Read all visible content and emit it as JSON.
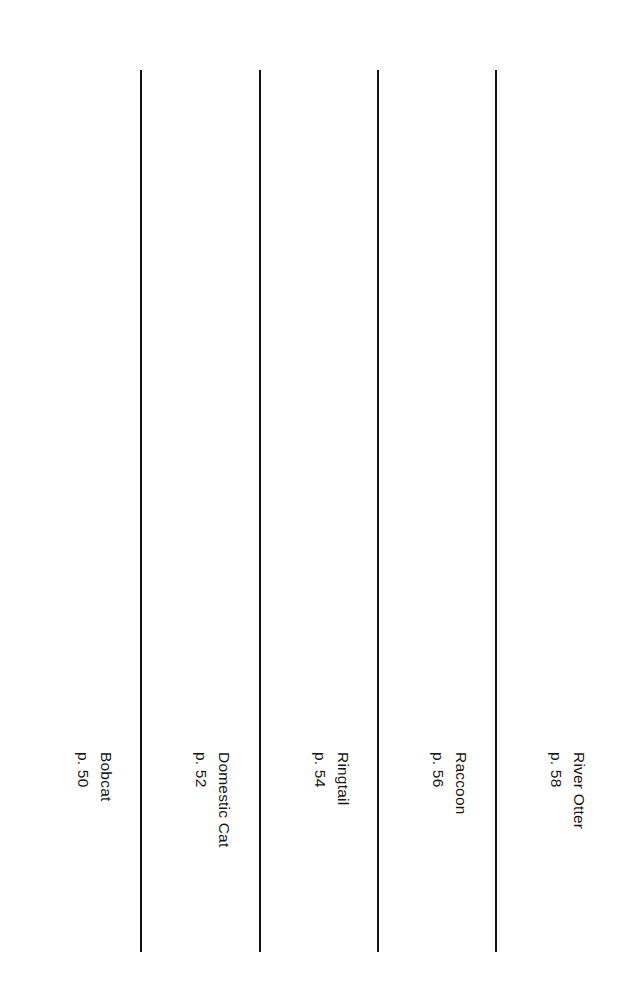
{
  "plate": {
    "title": "Animal Tracks Comparison Plate",
    "background_color": "#ffffff",
    "ink_color": "#2b2b2b",
    "divider_color": "#121212",
    "width": 628,
    "height": 998
  },
  "columns": [
    {
      "id": "bobcat",
      "name": "Bobcat",
      "page": "p. 50",
      "print_type": "feline-four-toe",
      "claws": false,
      "gait": "alternating-single-diagonal-walk",
      "specimen_print": {
        "x": 78,
        "y": 125,
        "scale": 1.0,
        "tone": 0.78
      },
      "trail_tracks": [
        {
          "x": 62,
          "y": 228,
          "scale": 0.3,
          "tone": 0.8,
          "rot": -4
        },
        {
          "x": 110,
          "y": 332,
          "scale": 0.3,
          "tone": 0.8,
          "rot": 4
        },
        {
          "x": 62,
          "y": 453,
          "scale": 0.3,
          "tone": 0.8,
          "rot": -3
        },
        {
          "x": 103,
          "y": 570,
          "scale": 0.3,
          "tone": 0.8,
          "rot": 3
        },
        {
          "x": 58,
          "y": 686,
          "scale": 0.3,
          "tone": 0.8,
          "rot": -2
        }
      ],
      "label": {
        "name_x": 97,
        "name_y": 752,
        "page_x": 74,
        "page_y": 752
      }
    },
    {
      "id": "domestic-cat",
      "name": "Domestic Cat",
      "page": "p. 52",
      "print_type": "feline-four-toe",
      "claws": false,
      "gait": "paired-direct-register-walk",
      "specimen_print": {
        "x": 201,
        "y": 123,
        "scale": 0.92,
        "tone": 0.86
      },
      "trail_tracks": [
        {
          "x": 199,
          "y": 219,
          "scale": 0.22,
          "tone": 0.8,
          "rot": -3
        },
        {
          "x": 200,
          "y": 243,
          "scale": 0.22,
          "tone": 0.8,
          "rot": 2
        },
        {
          "x": 221,
          "y": 362,
          "scale": 0.22,
          "tone": 0.8,
          "rot": -2
        },
        {
          "x": 223,
          "y": 386,
          "scale": 0.22,
          "tone": 0.8,
          "rot": 3
        },
        {
          "x": 182,
          "y": 489,
          "scale": 0.22,
          "tone": 0.8,
          "rot": -3
        },
        {
          "x": 184,
          "y": 514,
          "scale": 0.22,
          "tone": 0.8,
          "rot": 2
        },
        {
          "x": 203,
          "y": 639,
          "scale": 0.22,
          "tone": 0.8,
          "rot": 0
        },
        {
          "x": 180,
          "y": 718,
          "scale": 0.22,
          "tone": 0.8,
          "rot": 0
        }
      ],
      "label": {
        "name_x": 215,
        "name_y": 752,
        "page_x": 192,
        "page_y": 752
      }
    },
    {
      "id": "ringtail",
      "name": "Ringtail",
      "page": "p. 54",
      "print_type": "ringtail-five-toe",
      "claws": true,
      "gait": "overlapping-pair-bound",
      "specimen_print": {
        "x": 319,
        "y": 124,
        "scale": 0.9,
        "tone": 0.6
      },
      "trail_tracks": [
        {
          "x": 297,
          "y": 222,
          "scale": 0.26,
          "tone": 0.7,
          "rot": -6
        },
        {
          "x": 344,
          "y": 358,
          "scale": 0.26,
          "tone": 0.7,
          "rot": 5
        },
        {
          "x": 293,
          "y": 485,
          "scale": 0.26,
          "tone": 0.7,
          "rot": -5
        },
        {
          "x": 349,
          "y": 596,
          "scale": 0.26,
          "tone": 0.7,
          "rot": 4
        },
        {
          "x": 297,
          "y": 680,
          "scale": 0.26,
          "tone": 0.7,
          "rot": -4
        }
      ],
      "label": {
        "name_x": 334,
        "name_y": 752,
        "page_x": 311,
        "page_y": 752
      }
    },
    {
      "id": "raccoon",
      "name": "Raccoon",
      "page": "p. 56",
      "print_type": "raccoon-hand",
      "claws": true,
      "gait": "paired-side-by-side-pace",
      "specimen_print": {
        "x": 436,
        "y": 120,
        "scale": 0.95,
        "tone": 0.74
      },
      "trail_tracks": [
        {
          "x": 409,
          "y": 232,
          "scale": 0.4,
          "tone": 0.84,
          "rot": -5
        },
        {
          "x": 458,
          "y": 234,
          "scale": 0.34,
          "tone": 0.84,
          "rot": 4
        },
        {
          "x": 410,
          "y": 383,
          "scale": 0.36,
          "tone": 0.84,
          "rot": -4
        },
        {
          "x": 459,
          "y": 381,
          "scale": 0.42,
          "tone": 0.84,
          "rot": 3
        },
        {
          "x": 410,
          "y": 528,
          "scale": 0.42,
          "tone": 0.84,
          "rot": -4
        },
        {
          "x": 459,
          "y": 532,
          "scale": 0.34,
          "tone": 0.84,
          "rot": 3
        },
        {
          "x": 411,
          "y": 678,
          "scale": 0.34,
          "tone": 0.84,
          "rot": -3
        },
        {
          "x": 460,
          "y": 676,
          "scale": 0.42,
          "tone": 0.84,
          "rot": 4
        }
      ],
      "label": {
        "name_x": 452,
        "name_y": 752,
        "page_x": 429,
        "page_y": 752
      }
    },
    {
      "id": "river-otter",
      "name": "River Otter",
      "page": "p. 58",
      "print_type": "otter-five-toe",
      "claws": true,
      "gait": "lope-with-tail-drag",
      "tail_drag": true,
      "specimen_print": {
        "x": 555,
        "y": 118,
        "scale": 0.92,
        "tone": 0.72
      },
      "trail_tracks": [
        {
          "x": 561,
          "y": 222,
          "scale": 0.3,
          "tone": 0.82,
          "rot": 10
        },
        {
          "x": 537,
          "y": 252,
          "scale": 0.27,
          "tone": 0.82,
          "rot": -8
        },
        {
          "x": 578,
          "y": 277,
          "scale": 0.27,
          "tone": 0.82,
          "rot": 8
        },
        {
          "x": 570,
          "y": 302,
          "scale": 0.27,
          "tone": 0.82,
          "rot": 6
        },
        {
          "x": 530,
          "y": 382,
          "scale": 0.29,
          "tone": 0.82,
          "rot": -10
        },
        {
          "x": 557,
          "y": 432,
          "scale": 0.29,
          "tone": 0.82,
          "rot": 4
        },
        {
          "x": 580,
          "y": 466,
          "scale": 0.27,
          "tone": 0.82,
          "rot": 8
        },
        {
          "x": 537,
          "y": 550,
          "scale": 0.29,
          "tone": 0.82,
          "rot": -8
        },
        {
          "x": 568,
          "y": 575,
          "scale": 0.27,
          "tone": 0.82,
          "rot": 6
        },
        {
          "x": 551,
          "y": 629,
          "scale": 0.29,
          "tone": 0.82,
          "rot": -4
        },
        {
          "x": 572,
          "y": 678,
          "scale": 0.27,
          "tone": 0.82,
          "rot": 5
        }
      ],
      "label": {
        "name_x": 570,
        "name_y": 752,
        "page_x": 547,
        "page_y": 752
      }
    }
  ],
  "dividers": [
    {
      "x": 140
    },
    {
      "x": 259
    },
    {
      "x": 377
    },
    {
      "x": 495
    }
  ]
}
